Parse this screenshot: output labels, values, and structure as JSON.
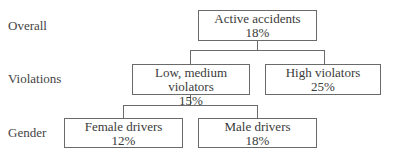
{
  "levels": [
    {
      "label": "Overall"
    },
    {
      "label": "Violations"
    },
    {
      "label": "Gender"
    }
  ],
  "nodes": {
    "root": {
      "title": "Active accidents",
      "value": "18%"
    },
    "low_medium": {
      "title": "Low, medium violators",
      "value": "15%"
    },
    "high": {
      "title": "High violators",
      "value": "25%"
    },
    "female": {
      "title": "Female drivers",
      "value": "12%"
    },
    "male": {
      "title": "Male drivers",
      "value": "18%"
    }
  },
  "edges": [
    {
      "from": "root",
      "to": "low_medium"
    },
    {
      "from": "root",
      "to": "high"
    },
    {
      "from": "low_medium",
      "to": "female"
    },
    {
      "from": "low_medium",
      "to": "male"
    }
  ],
  "colors": {
    "line": "#6a6a6a",
    "text": "#3a3a3a",
    "background": "#ffffff"
  }
}
